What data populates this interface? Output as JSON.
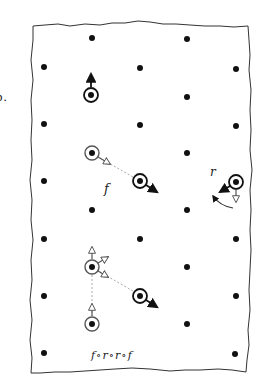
{
  "figure": {
    "panel_label": "b.",
    "colors": {
      "ink": "#111111",
      "hollow_ink": "#555555",
      "dashed_line": "#aaaaaa",
      "background": "#ffffff",
      "border": "#333333"
    }
  },
  "lattice": {
    "description": "Hexagonal/triangular lattice of dots on a torn-paper sheet",
    "dots": [
      {
        "x": 92,
        "y": 38
      },
      {
        "x": 187,
        "y": 39
      },
      {
        "x": 44,
        "y": 67
      },
      {
        "x": 140,
        "y": 68
      },
      {
        "x": 236,
        "y": 69
      },
      {
        "x": 187,
        "y": 97
      },
      {
        "x": 44,
        "y": 124
      },
      {
        "x": 140,
        "y": 125
      },
      {
        "x": 236,
        "y": 126
      },
      {
        "x": 187,
        "y": 153
      },
      {
        "x": 44,
        "y": 181
      },
      {
        "x": 92,
        "y": 210
      },
      {
        "x": 187,
        "y": 210
      },
      {
        "x": 44,
        "y": 239
      },
      {
        "x": 140,
        "y": 239
      },
      {
        "x": 236,
        "y": 239
      },
      {
        "x": 187,
        "y": 267
      },
      {
        "x": 44,
        "y": 296
      },
      {
        "x": 236,
        "y": 296
      },
      {
        "x": 187,
        "y": 324
      },
      {
        "x": 44,
        "y": 353
      },
      {
        "x": 235,
        "y": 354
      }
    ]
  },
  "marked_points": [
    {
      "id": "p-top",
      "x": 91,
      "y": 95,
      "style": "solid",
      "arrows": [
        {
          "dir": "up",
          "style": "solid",
          "x2": 91,
          "y2": 72
        }
      ]
    },
    {
      "id": "p-f-source",
      "x": 92,
      "y": 153,
      "style": "hollow",
      "arrows": [
        {
          "dir": "down-right",
          "style": "hollow",
          "x2": 110,
          "y2": 164
        }
      ]
    },
    {
      "id": "p-f-target",
      "x": 140,
      "y": 181,
      "style": "solid",
      "arrows": [
        {
          "dir": "down-right",
          "style": "solid",
          "x2": 158,
          "y2": 192
        }
      ]
    },
    {
      "id": "p-r",
      "x": 236,
      "y": 182,
      "style": "solid",
      "arrows": [
        {
          "dir": "down-left",
          "style": "solid",
          "x2": 219,
          "y2": 192
        },
        {
          "dir": "down",
          "style": "hollow",
          "x2": 236,
          "y2": 203
        }
      ]
    },
    {
      "id": "p-multi",
      "x": 92,
      "y": 267,
      "style": "hollow",
      "arrows": [
        {
          "dir": "up",
          "style": "hollow",
          "x2": 92,
          "y2": 246
        },
        {
          "dir": "up-right",
          "style": "hollow",
          "x2": 108,
          "y2": 258
        },
        {
          "dir": "down-right",
          "style": "hollow",
          "x2": 108,
          "y2": 277
        }
      ]
    },
    {
      "id": "p-bottom-target",
      "x": 140,
      "y": 296,
      "style": "solid",
      "arrows": [
        {
          "dir": "down-right",
          "style": "solid",
          "x2": 158,
          "y2": 307
        }
      ]
    },
    {
      "id": "p-bottom",
      "x": 92,
      "y": 324,
      "style": "hollow",
      "arrows": [
        {
          "dir": "up",
          "style": "hollow",
          "x2": 92,
          "y2": 302
        }
      ]
    }
  ],
  "connectors": [
    {
      "from": "p-f-source",
      "to": "p-f-target",
      "style": "dashed"
    },
    {
      "from": "p-multi",
      "to": "p-bottom-target",
      "style": "dashed"
    },
    {
      "from": "p-multi",
      "to": "p-bottom",
      "style": "dashed"
    }
  ],
  "labels": {
    "f_label": "f",
    "r_label": "r",
    "composition_label": "f∘r∘r∘f"
  },
  "rotation_arc": {
    "description": "curved arrow indicating rotation r",
    "around": "p-r"
  }
}
